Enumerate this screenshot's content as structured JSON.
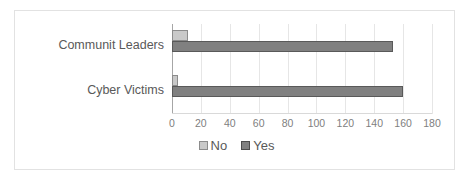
{
  "chart_data": {
    "type": "bar",
    "orientation": "horizontal",
    "title": "",
    "xlabel": "",
    "ylabel": "",
    "categories": [
      "Communit Leaders",
      "Cyber Victims"
    ],
    "series": [
      {
        "name": "No",
        "values": [
          11,
          4
        ],
        "color": "#c9c9c9"
      },
      {
        "name": "Yes",
        "values": [
          153,
          160
        ],
        "color": "#808080"
      }
    ],
    "xlim": [
      0,
      180
    ],
    "xticks": [
      0,
      20,
      40,
      60,
      80,
      100,
      120,
      140,
      160,
      180
    ],
    "xtick_labels": [
      "0",
      "20",
      "40",
      "60",
      "80",
      "100",
      "120",
      "140",
      "160",
      "180"
    ],
    "grid": "vertical",
    "legend": {
      "position": "bottom",
      "entries": [
        "No",
        "Yes"
      ]
    }
  },
  "colors": {
    "no": "#c9c9c9",
    "yes": "#808080",
    "gridline": "#e6e6e6",
    "axis": "#a6a6a6",
    "frame": "#e2e2e2",
    "text": "#595959",
    "tick_text": "#808080",
    "background": "#ffffff"
  }
}
